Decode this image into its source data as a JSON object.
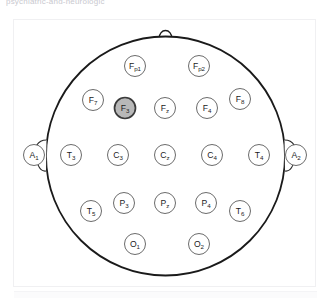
{
  "page": {
    "top_caption": "psychiatric-and-neurologic",
    "diagram_title": "EEG 10-20 electrode placement map"
  },
  "diagram": {
    "view": "top-down head map",
    "nose_marker": "nose",
    "left_ear_marker": "left-ear",
    "right_ear_marker": "right-ear",
    "head_outline_color": "#1a1a1a",
    "electrode_stroke_color": "#5a5a5a",
    "electrode_fill_color": "#ffffff",
    "highlight_fill_color": "#b8b8b8",
    "highlight_stroke_color": "#3a3a3a",
    "label_color": "#1b1b1b",
    "highlighted_electrode": "F3",
    "electrodes": [
      {
        "id": "Fp1",
        "base": "F",
        "sub": "p1",
        "cx": 122,
        "cy": 47,
        "r": 10.5,
        "highlighted": false
      },
      {
        "id": "Fp2",
        "base": "F",
        "sub": "p2",
        "cx": 186,
        "cy": 47,
        "r": 10.5,
        "highlighted": false
      },
      {
        "id": "F7",
        "base": "F",
        "sub": "7",
        "cx": 80,
        "cy": 81,
        "r": 10.5,
        "highlighted": false
      },
      {
        "id": "F3",
        "base": "F",
        "sub": "3",
        "cx": 112,
        "cy": 89,
        "r": 10.5,
        "highlighted": true
      },
      {
        "id": "Fz",
        "base": "F",
        "sub": "z",
        "cx": 152,
        "cy": 89,
        "r": 10.5,
        "highlighted": false
      },
      {
        "id": "F4",
        "base": "F",
        "sub": "4",
        "cx": 194,
        "cy": 89,
        "r": 10.5,
        "highlighted": false
      },
      {
        "id": "F8",
        "base": "F",
        "sub": "8",
        "cx": 227,
        "cy": 80,
        "r": 10.5,
        "highlighted": false
      },
      {
        "id": "A1",
        "base": "A",
        "sub": "1",
        "cx": 21,
        "cy": 136,
        "r": 10.5,
        "highlighted": false
      },
      {
        "id": "T3",
        "base": "T",
        "sub": "3",
        "cx": 58,
        "cy": 136,
        "r": 10.5,
        "highlighted": false
      },
      {
        "id": "C3",
        "base": "C",
        "sub": "3",
        "cx": 105,
        "cy": 136,
        "r": 10.5,
        "highlighted": false
      },
      {
        "id": "Cz",
        "base": "C",
        "sub": "z",
        "cx": 152,
        "cy": 136,
        "r": 10.5,
        "highlighted": false
      },
      {
        "id": "C4",
        "base": "C",
        "sub": "4",
        "cx": 199,
        "cy": 136,
        "r": 10.5,
        "highlighted": false
      },
      {
        "id": "T4",
        "base": "T",
        "sub": "4",
        "cx": 246,
        "cy": 136,
        "r": 10.5,
        "highlighted": false
      },
      {
        "id": "A2",
        "base": "A",
        "sub": "2",
        "cx": 283,
        "cy": 136,
        "r": 10.5,
        "highlighted": false
      },
      {
        "id": "T5",
        "base": "T",
        "sub": "5",
        "cx": 78,
        "cy": 192,
        "r": 10.5,
        "highlighted": false
      },
      {
        "id": "P3",
        "base": "P",
        "sub": "3",
        "cx": 111,
        "cy": 184,
        "r": 10.5,
        "highlighted": false
      },
      {
        "id": "Pz",
        "base": "P",
        "sub": "z",
        "cx": 152,
        "cy": 184,
        "r": 10.5,
        "highlighted": false
      },
      {
        "id": "P4",
        "base": "P",
        "sub": "4",
        "cx": 193,
        "cy": 184,
        "r": 10.5,
        "highlighted": false
      },
      {
        "id": "T6",
        "base": "T",
        "sub": "6",
        "cx": 227,
        "cy": 192,
        "r": 10.5,
        "highlighted": false
      },
      {
        "id": "O1",
        "base": "O",
        "sub": "1",
        "cx": 122,
        "cy": 225,
        "r": 10.5,
        "highlighted": false
      },
      {
        "id": "O2",
        "base": "O",
        "sub": "2",
        "cx": 186,
        "cy": 225,
        "r": 10.5,
        "highlighted": false
      }
    ]
  }
}
